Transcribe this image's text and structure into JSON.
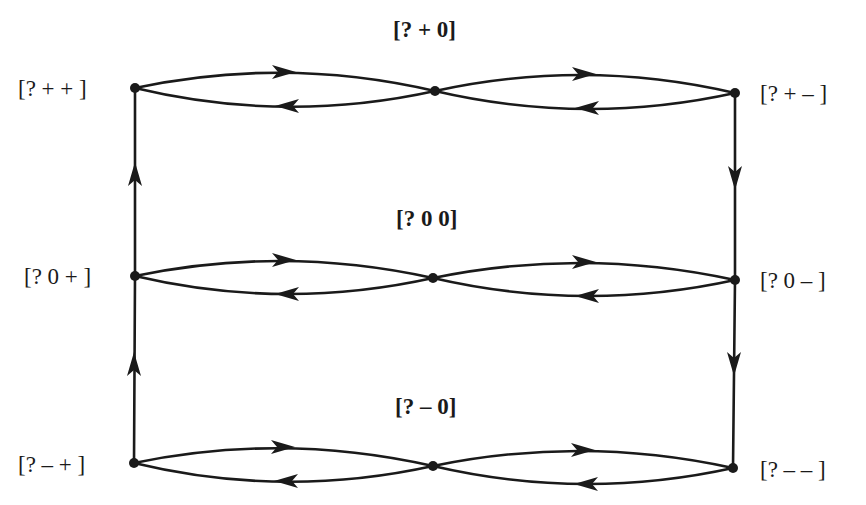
{
  "diagram": {
    "type": "state-transition-graph",
    "line_color": "#1a1a1a",
    "background": "#ffffff",
    "labels": {
      "pp": "[? + + ]",
      "p0": "[? + 0]",
      "pm": "[? + – ]",
      "zp": "[? 0 + ]",
      "zz": "[? 0 0]",
      "zm": "[? 0 – ]",
      "mp": "[? – + ]",
      "m0": "[? – 0]",
      "mm": "[? – – ]"
    },
    "nodes": [
      {
        "id": "pp",
        "x": 135,
        "y": 88
      },
      {
        "id": "p0",
        "x": 435,
        "y": 91
      },
      {
        "id": "pm",
        "x": 735,
        "y": 93
      },
      {
        "id": "zp",
        "x": 135,
        "y": 276
      },
      {
        "id": "zz",
        "x": 433,
        "y": 278
      },
      {
        "id": "zm",
        "x": 735,
        "y": 280
      },
      {
        "id": "mp",
        "x": 134,
        "y": 463
      },
      {
        "id": "m0",
        "x": 433,
        "y": 466
      },
      {
        "id": "mm",
        "x": 733,
        "y": 468
      }
    ],
    "edges": [
      {
        "from": "pp",
        "to": "p0"
      },
      {
        "from": "p0",
        "to": "pp"
      },
      {
        "from": "p0",
        "to": "pm"
      },
      {
        "from": "pm",
        "to": "p0"
      },
      {
        "from": "zp",
        "to": "zz"
      },
      {
        "from": "zz",
        "to": "zp"
      },
      {
        "from": "zz",
        "to": "zm"
      },
      {
        "from": "zm",
        "to": "zz"
      },
      {
        "from": "mp",
        "to": "m0"
      },
      {
        "from": "m0",
        "to": "mp"
      },
      {
        "from": "m0",
        "to": "mm"
      },
      {
        "from": "mm",
        "to": "m0"
      },
      {
        "from": "mp",
        "to": "zp"
      },
      {
        "from": "zp",
        "to": "pp"
      },
      {
        "from": "pm",
        "to": "zm"
      },
      {
        "from": "zm",
        "to": "mm"
      }
    ]
  }
}
